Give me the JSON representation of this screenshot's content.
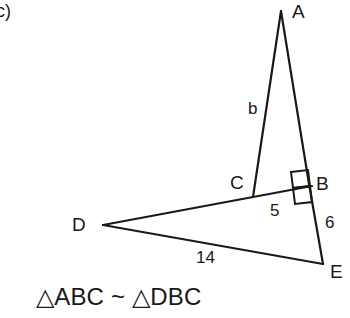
{
  "figure": {
    "item_tag": "c)",
    "background_color": "#ffffff",
    "stroke_color": "#191919",
    "vertices": [
      {
        "name": "A",
        "label": "A",
        "x": 281,
        "y": 11,
        "label_x": 292,
        "label_y": 2
      },
      {
        "name": "B",
        "label": "B",
        "x": 309,
        "y": 184,
        "label_x": 316,
        "label_y": 174
      },
      {
        "name": "C",
        "label": "C",
        "x": 253,
        "y": 197,
        "label_x": 230,
        "label_y": 173
      },
      {
        "name": "D",
        "label": "D",
        "x": 103,
        "y": 225,
        "label_x": 72,
        "label_y": 215
      },
      {
        "name": "E",
        "label": "E",
        "x": 323,
        "y": 264,
        "label_x": 330,
        "label_y": 262
      }
    ],
    "segments": [
      {
        "name": "segment-AC",
        "from": "A",
        "to": "C"
      },
      {
        "name": "segment-AB",
        "from": "A",
        "to": "B"
      },
      {
        "name": "segment-BE",
        "from": "B",
        "to": "E"
      },
      {
        "name": "segment-DB",
        "from": "D",
        "to": "B"
      },
      {
        "name": "segment-DE",
        "from": "D",
        "to": "E"
      }
    ],
    "side_labels": [
      {
        "name": "label-b",
        "text": "b",
        "x": 248,
        "y": 100,
        "for": "segment-AC"
      },
      {
        "name": "label-5",
        "text": "5",
        "x": 270,
        "y": 202,
        "for": "segment-CB"
      },
      {
        "name": "label-6",
        "text": "6",
        "x": 325,
        "y": 214,
        "for": "segment-BE"
      },
      {
        "name": "label-14",
        "text": "14",
        "x": 196,
        "y": 249,
        "for": "segment-DE"
      }
    ],
    "right_angle_marks": [
      {
        "name": "right-angle-mark-upper",
        "description": "square at B above line DB"
      },
      {
        "name": "right-angle-mark-lower",
        "description": "square at B below line DB"
      }
    ],
    "similarity_statement": "△ABC ~ △DBC"
  }
}
